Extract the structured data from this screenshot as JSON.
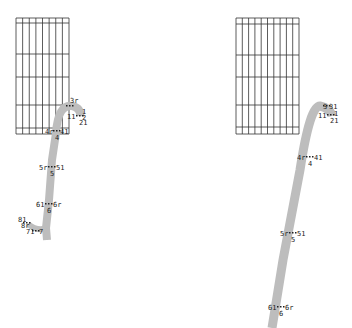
{
  "colors": {
    "background": "#ffffff",
    "grid": "#333333",
    "stroke": "#bdbdbd",
    "label": "#222222",
    "point": "#222222"
  },
  "panels": [
    {
      "id": "left",
      "grid": {
        "x0": 16,
        "x1": 69,
        "columns": 8,
        "rows_y": [
          18,
          23,
          54,
          77,
          105,
          128,
          134
        ]
      },
      "stroke_path": "M 47 240 L 46 228 L 49 200 L 52 160 L 56 133 Q 58 104 72 106 Q 81 108 80 116",
      "stroke_width": 8,
      "tail_path": "M 46 228 Q 38 232 28 224",
      "points": [
        {
          "id": "3",
          "labels": [
            {
              "text": "3r",
              "dx": 0,
              "dy": -3
            }
          ],
          "x": 70,
          "y": 106
        },
        {
          "id": "1",
          "labels": [
            {
              "text": "1",
              "dx": 2,
              "dy": -2
            },
            {
              "text": "11",
              "dx": -13,
              "dy": 3
            },
            {
              "text": "2",
              "dx": 2,
              "dy": 4
            },
            {
              "text": "21",
              "dx": -1,
              "dy": 9
            }
          ],
          "x": 80,
          "y": 116
        },
        {
          "id": "4",
          "labels": [
            {
              "text": "4r",
              "dx": -12,
              "dy": 3
            },
            {
              "text": "41",
              "dx": 3,
              "dy": 3
            },
            {
              "text": "4",
              "dx": -2,
              "dy": 9
            }
          ],
          "x": 57,
          "y": 131
        },
        {
          "id": "5",
          "labels": [
            {
              "text": "5r",
              "dx": -13,
              "dy": 3
            },
            {
              "text": "51",
              "dx": 4,
              "dy": 3
            },
            {
              "text": "5",
              "dx": -2,
              "dy": 9
            }
          ],
          "x": 52,
          "y": 167
        },
        {
          "id": "6",
          "labels": [
            {
              "text": "61",
              "dx": -13,
              "dy": 3
            },
            {
              "text": "6r",
              "dx": 4,
              "dy": 3
            },
            {
              "text": "6",
              "dx": -2,
              "dy": 9
            }
          ],
          "x": 49,
          "y": 204
        },
        {
          "id": "8",
          "labels": [
            {
              "text": "81",
              "dx": -9,
              "dy": -1
            },
            {
              "text": "8r",
              "dx": -6,
              "dy": 5
            }
          ],
          "x": 27,
          "y": 223
        },
        {
          "id": "7",
          "labels": [
            {
              "text": "71",
              "dx": -10,
              "dy": 3
            },
            {
              "text": "7",
              "dx": 3,
              "dy": 3
            }
          ],
          "x": 36,
          "y": 231
        }
      ]
    },
    {
      "id": "right",
      "grid": {
        "x0": 236,
        "x1": 299,
        "columns": 10,
        "rows_y": [
          18,
          24,
          55,
          77,
          105,
          127,
          134
        ]
      },
      "stroke_path": "M 272 328 L 283 260 L 300 170 Q 310 105 320 106 Q 330 108 332 116",
      "stroke_width": 9,
      "tail_path": "",
      "points": [
        {
          "id": "3",
          "labels": [
            {
              "text": "3",
              "dx": -4,
              "dy": 3
            },
            {
              "text": "31",
              "dx": 2,
              "dy": 3
            }
          ],
          "x": 327,
          "y": 106
        },
        {
          "id": "1",
          "labels": [
            {
              "text": "11",
              "dx": -13,
              "dy": 3
            },
            {
              "text": "1",
              "dx": 3,
              "dy": 1
            },
            {
              "text": "21",
              "dx": -1,
              "dy": 8
            }
          ],
          "x": 331,
          "y": 115
        },
        {
          "id": "4",
          "labels": [
            {
              "text": "4r",
              "dx": -13,
              "dy": 3
            },
            {
              "text": "41",
              "dx": 4,
              "dy": 3
            },
            {
              "text": "4",
              "dx": -2,
              "dy": 9
            }
          ],
          "x": 310,
          "y": 157
        },
        {
          "id": "5",
          "labels": [
            {
              "text": "5r",
              "dx": -13,
              "dy": 3
            },
            {
              "text": "51",
              "dx": 4,
              "dy": 3
            },
            {
              "text": "5",
              "dx": -2,
              "dy": 9
            }
          ],
          "x": 293,
          "y": 233
        },
        {
          "id": "6",
          "labels": [
            {
              "text": "61",
              "dx": -13,
              "dy": 3
            },
            {
              "text": "6r",
              "dx": 4,
              "dy": 3
            },
            {
              "text": "6",
              "dx": -2,
              "dy": 9
            }
          ],
          "x": 281,
          "y": 307
        }
      ]
    }
  ]
}
